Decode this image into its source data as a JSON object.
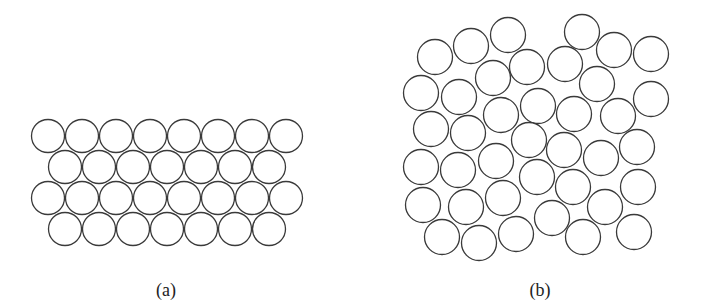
{
  "figure": {
    "panels": [
      {
        "id": "a",
        "label": "(a)",
        "description": "ordered close-packed arrangement of circles, 4 rows alternating 8 and 7",
        "rows": [
          {
            "count": 8,
            "cx_start": 48,
            "cy": 136
          },
          {
            "count": 7,
            "cx_start": 65,
            "cy": 167
          },
          {
            "count": 8,
            "cx_start": 48,
            "cy": 198
          },
          {
            "count": 7,
            "cx_start": 65,
            "cy": 229
          }
        ],
        "pitch": 34,
        "radius": 16.5,
        "label_pos": {
          "x": 166,
          "y": 281
        }
      },
      {
        "id": "b",
        "label": "(b)",
        "description": "random disordered arrangement of circles",
        "radius": 17.5,
        "circles": [
          [
            435,
            57
          ],
          [
            471,
            46
          ],
          [
            508,
            35
          ],
          [
            582,
            32
          ],
          [
            614,
            50
          ],
          [
            651,
            54
          ],
          [
            493,
            78
          ],
          [
            527,
            67
          ],
          [
            565,
            64
          ],
          [
            421,
            93
          ],
          [
            459,
            97
          ],
          [
            597,
            84
          ],
          [
            651,
            99
          ],
          [
            538,
            106
          ],
          [
            501,
            115
          ],
          [
            574,
            114
          ],
          [
            618,
            116
          ],
          [
            431,
            129
          ],
          [
            468,
            133
          ],
          [
            529,
            140
          ],
          [
            564,
            150
          ],
          [
            601,
            158
          ],
          [
            637,
            147
          ],
          [
            421,
            167
          ],
          [
            458,
            170
          ],
          [
            496,
            161
          ],
          [
            537,
            177
          ],
          [
            573,
            187
          ],
          [
            638,
            187
          ],
          [
            423,
            205
          ],
          [
            466,
            207
          ],
          [
            503,
            198
          ],
          [
            552,
            218
          ],
          [
            605,
            207
          ],
          [
            442,
            237
          ],
          [
            479,
            243
          ],
          [
            516,
            234
          ],
          [
            583,
            237
          ],
          [
            634,
            232
          ]
        ],
        "label_pos": {
          "x": 540,
          "y": 281
        }
      }
    ]
  },
  "style": {
    "stroke_color": "#3a3a3a",
    "background": "#ffffff"
  }
}
